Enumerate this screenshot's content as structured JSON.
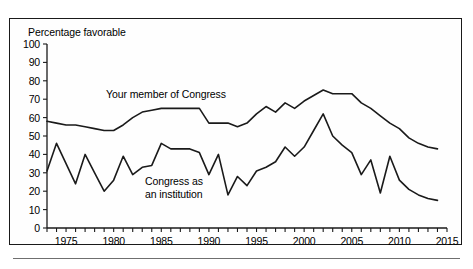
{
  "chart_data": {
    "type": "line",
    "title": "",
    "subtitle": "",
    "ylabel": "Percentage favorable",
    "xlabel": "",
    "ylim": [
      0,
      100
    ],
    "xlim": [
      1973,
      2015
    ],
    "ytick_step": 10,
    "xtick_step": 1,
    "xlabel_step": 5,
    "grid": false,
    "legend": "inline-annotations",
    "yticks": [
      "0",
      "10",
      "20",
      "30",
      "40",
      "50",
      "60",
      "70",
      "80",
      "90",
      "100"
    ],
    "xticks": [
      "1975",
      "1980",
      "1985",
      "1990",
      "1995",
      "2000",
      "2005",
      "2010",
      "2015"
    ],
    "series": [
      {
        "name": "Your member of Congress",
        "color": "#1a1a1a",
        "x": [
          1973,
          1974,
          1975,
          1976,
          1977,
          1978,
          1979,
          1980,
          1981,
          1982,
          1983,
          1984,
          1985,
          1986,
          1987,
          1988,
          1989,
          1990,
          1991,
          1992,
          1993,
          1994,
          1995,
          1996,
          1997,
          1998,
          1999,
          2000,
          2001,
          2002,
          2003,
          2004,
          2005,
          2006,
          2007,
          2008,
          2009,
          2010,
          2011,
          2012,
          2013,
          2014
        ],
        "values": [
          58,
          57,
          56,
          56,
          55,
          54,
          53,
          53,
          56,
          60,
          63,
          64,
          65,
          65,
          65,
          65,
          65,
          57,
          57,
          57,
          55,
          57,
          62,
          66,
          63,
          68,
          65,
          69,
          72,
          75,
          73,
          73,
          73,
          68,
          65,
          61,
          57,
          54,
          49,
          46,
          44,
          43
        ]
      },
      {
        "name": "Congress as an institution",
        "color": "#1a1a1a",
        "x": [
          1973,
          1974,
          1975,
          1976,
          1977,
          1978,
          1979,
          1980,
          1981,
          1982,
          1983,
          1984,
          1985,
          1986,
          1987,
          1988,
          1989,
          1990,
          1991,
          1992,
          1993,
          1994,
          1995,
          1996,
          1997,
          1998,
          1999,
          2000,
          2001,
          2002,
          2003,
          2004,
          2005,
          2006,
          2007,
          2008,
          2009,
          2010,
          2011,
          2012,
          2013,
          2014
        ],
        "values": [
          31,
          46,
          35,
          24,
          40,
          30,
          20,
          26,
          39,
          29,
          33,
          34,
          46,
          43,
          43,
          43,
          41,
          29,
          40,
          18,
          28,
          23,
          31,
          33,
          36,
          44,
          39,
          44,
          53,
          62,
          50,
          45,
          41,
          29,
          37,
          19,
          39,
          26,
          21,
          18,
          16,
          15
        ]
      }
    ]
  },
  "chart_layout": {
    "plot_left_px": 47,
    "plot_right_px": 447,
    "plot_top_px": 44,
    "plot_bottom_px": 228,
    "x_min_year": 1973,
    "x_max_year": 2015,
    "y_min": 0,
    "y_max": 100,
    "tick_len_px": 4,
    "line_width_px": 1.6
  },
  "annotations": {
    "series_one_label": "Your member of Congress",
    "series_two_label_line1": "Congress as",
    "series_two_label_line2": "an institution"
  }
}
